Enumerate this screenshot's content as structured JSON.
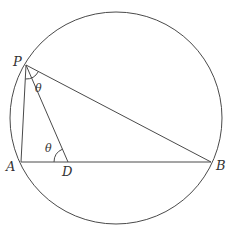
{
  "diagram": {
    "type": "geometry",
    "colors": {
      "stroke": "#4a4a4a",
      "text": "#333333",
      "background": "#ffffff"
    },
    "circle": {
      "cx": 116,
      "cy": 118,
      "r": 106
    },
    "points": {
      "P": {
        "label": "P",
        "x": 26,
        "y": 65,
        "label_x": 13,
        "label_y": 66
      },
      "A": {
        "label": "A",
        "x": 21,
        "y": 162,
        "label_x": 6,
        "label_y": 171
      },
      "D": {
        "label": "D",
        "x": 68,
        "y": 162,
        "label_x": 62,
        "label_y": 176
      },
      "B": {
        "label": "B",
        "x": 211,
        "y": 162,
        "label_x": 216,
        "label_y": 170
      }
    },
    "segments": [
      {
        "name": "PA",
        "from": "P",
        "to": "A"
      },
      {
        "name": "PB",
        "from": "P",
        "to": "B"
      },
      {
        "name": "PD",
        "from": "P",
        "to": "D"
      },
      {
        "name": "AB",
        "from": "A",
        "to": "B"
      }
    ],
    "angle_marks": [
      {
        "name": "angle-at-P",
        "vertex": "P",
        "label": "θ",
        "label_x": 35,
        "label_y": 92
      },
      {
        "name": "angle-at-D",
        "vertex": "D",
        "label": "θ",
        "label_x": 45,
        "label_y": 152
      }
    ]
  }
}
